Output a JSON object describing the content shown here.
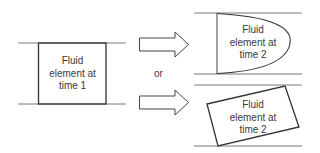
{
  "diagram": {
    "left_element": {
      "line1": "Fluid",
      "line2": "element at",
      "line3": "time 1"
    },
    "connector_text": "or",
    "top_right_element": {
      "line1": "Fluid",
      "line2": "element at",
      "line3": "time 2",
      "shape": "parabolic-deformation"
    },
    "bottom_right_element": {
      "line1": "Fluid",
      "line2": "element at",
      "line3": "time 2",
      "shape": "rotated-rectangle"
    },
    "colors": {
      "stroke": "#333333",
      "text": "#3a3a3a",
      "background": "#ffffff"
    }
  }
}
